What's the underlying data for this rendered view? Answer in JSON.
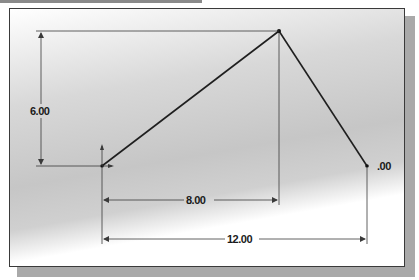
{
  "drawing": {
    "points": {
      "origin": {
        "x": 102,
        "y": 166
      },
      "apex": {
        "x": 279,
        "y": 31
      },
      "end": {
        "x": 367,
        "y": 166
      }
    },
    "dimensions": {
      "height": {
        "label": "6.00"
      },
      "horizontal_to_apex": {
        "label": "8.00"
      },
      "horizontal_total": {
        "label": "12.00"
      },
      "end_partial": {
        "label": ".00"
      }
    },
    "colors": {
      "line": "#1f1f1f",
      "dimension": "#3a3a3a",
      "frame_border": "#3a3a3a",
      "shadow": "#a9a9a9"
    }
  }
}
